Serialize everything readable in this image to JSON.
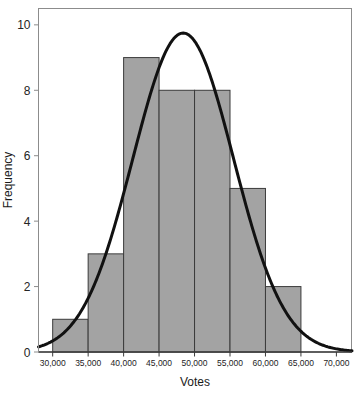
{
  "chart_data": {
    "type": "bar",
    "title": "",
    "subtitle": "",
    "xlabel": "Votes",
    "ylabel": "Frequency",
    "xlim": [
      28000,
      72200
    ],
    "ylim": [
      0,
      10.5
    ],
    "grid": false,
    "legend": null,
    "bin_width": 5000,
    "bin_edges": [
      30000,
      35000,
      40000,
      45000,
      50000,
      55000,
      60000,
      65000
    ],
    "categories": [
      "30,000-35,000",
      "35,000-40,000",
      "40,000-45,000",
      "45,000-50,000",
      "50,000-55,000",
      "55,000-60,000",
      "60,000-65,000"
    ],
    "values": [
      1,
      3,
      9,
      8,
      8,
      5,
      2
    ],
    "bar_fill_color": "#a3a3a3",
    "bar_edge_color": "#3b3b3b",
    "xticks": [
      30000,
      35000,
      40000,
      45000,
      50000,
      55000,
      60000,
      65000,
      70000
    ],
    "xtick_labels": [
      "30,000",
      "35,000",
      "40,000",
      "45,000",
      "50,000",
      "55,000",
      "60,000",
      "65,000",
      "70,000"
    ],
    "yticks": [
      0,
      2,
      4,
      6,
      8,
      10
    ],
    "ytick_labels": [
      "0",
      "2",
      "4",
      "6",
      "8",
      "10"
    ],
    "overlay_curve": {
      "name": "normal-distribution-curve",
      "type": "line",
      "color": "#111111",
      "line_width": 3,
      "peak_x": 48400,
      "peak_y": 9.75,
      "mean": 48400,
      "std_dev": 7100,
      "amplitude": 9.75
    }
  },
  "axes": {
    "x_title": "Votes",
    "y_title": "Frequency"
  }
}
